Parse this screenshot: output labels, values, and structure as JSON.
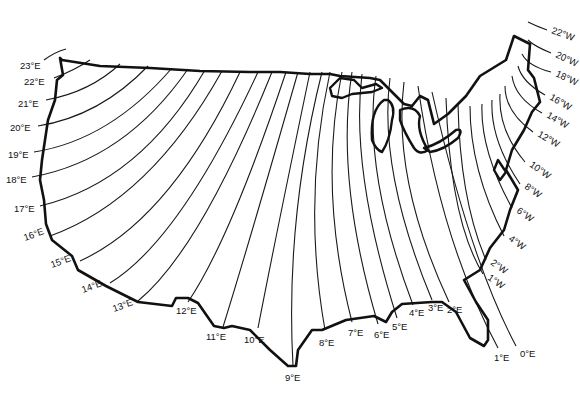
{
  "map": {
    "subject": "Isogonic lines (magnetic declination) of the contiguous United States",
    "colors": {
      "line": "#1a1a1a",
      "border": "#111111",
      "background": "#ffffff"
    },
    "east_labels": [
      {
        "text": "23°E",
        "x": 20,
        "y": 66
      },
      {
        "text": "22°E",
        "x": 24,
        "y": 85
      },
      {
        "text": "21°E",
        "x": 18,
        "y": 107
      },
      {
        "text": "20°E",
        "x": 10,
        "y": 131
      },
      {
        "text": "19°E",
        "x": 8,
        "y": 158
      },
      {
        "text": "18°E",
        "x": 6,
        "y": 183
      },
      {
        "text": "17°E",
        "x": 14,
        "y": 212
      },
      {
        "text": "16°E",
        "x": 25,
        "y": 241
      },
      {
        "text": "15°E",
        "x": 52,
        "y": 268
      },
      {
        "text": "14°E",
        "x": 83,
        "y": 293
      },
      {
        "text": "13°E",
        "x": 114,
        "y": 309
      },
      {
        "text": "12°E",
        "x": 176,
        "y": 313
      },
      {
        "text": "11°E",
        "x": 206,
        "y": 340
      },
      {
        "text": "10°E",
        "x": 244,
        "y": 343
      },
      {
        "text": "9°E",
        "x": 285,
        "y": 381
      },
      {
        "text": "8°E",
        "x": 319,
        "y": 346
      },
      {
        "text": "7°E",
        "x": 348,
        "y": 336
      },
      {
        "text": "6°E",
        "x": 374,
        "y": 338
      },
      {
        "text": "5°E",
        "x": 392,
        "y": 330
      },
      {
        "text": "4°E",
        "x": 409,
        "y": 316
      },
      {
        "text": "3°E",
        "x": 428,
        "y": 311
      },
      {
        "text": "2°E",
        "x": 447,
        "y": 313
      },
      {
        "text": "1°E",
        "x": 494,
        "y": 361
      },
      {
        "text": "0°E",
        "x": 520,
        "y": 357
      }
    ],
    "west_labels": [
      {
        "text": "1°W",
        "x": 487,
        "y": 279
      },
      {
        "text": "2°W",
        "x": 490,
        "y": 264
      },
      {
        "text": "4°W",
        "x": 508,
        "y": 240
      },
      {
        "text": "6°W",
        "x": 516,
        "y": 212
      },
      {
        "text": "8°W",
        "x": 524,
        "y": 188
      },
      {
        "text": "10°W",
        "x": 529,
        "y": 166
      },
      {
        "text": "12°W",
        "x": 537,
        "y": 136
      },
      {
        "text": "14°W",
        "x": 546,
        "y": 117
      },
      {
        "text": "16°W",
        "x": 549,
        "y": 99
      },
      {
        "text": "18°W",
        "x": 555,
        "y": 76
      },
      {
        "text": "20°W",
        "x": 555,
        "y": 57
      },
      {
        "text": "22°W",
        "x": 551,
        "y": 33
      }
    ]
  }
}
